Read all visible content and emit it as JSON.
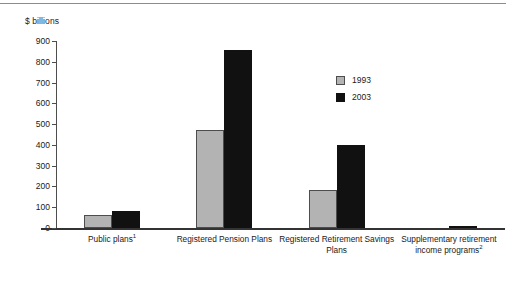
{
  "chart_data": {
    "type": "bar",
    "title": "",
    "ylabel": "$ billions",
    "xlabel": "",
    "ylim": [
      0,
      900
    ],
    "yticks": [
      0,
      100,
      200,
      300,
      400,
      500,
      600,
      700,
      800,
      900
    ],
    "grid": false,
    "legend_position": "center-right",
    "categories": [
      "Public plans¹",
      "Registered Pension Plans",
      "Registered Retirement Savings Plans",
      "Supplementary retirement income programs²"
    ],
    "series": [
      {
        "name": "1993",
        "color": "#b3b3b3",
        "values": [
          63,
          470,
          183,
          0
        ]
      },
      {
        "name": "2003",
        "color": "#111111",
        "values": [
          82,
          857,
          399,
          10
        ]
      }
    ]
  },
  "legend": {
    "items": [
      {
        "label": "1993",
        "swatch": "gray-square-swatch"
      },
      {
        "label": "2003",
        "swatch": "black-square-swatch"
      }
    ]
  },
  "footnote": {
    "text": ""
  }
}
